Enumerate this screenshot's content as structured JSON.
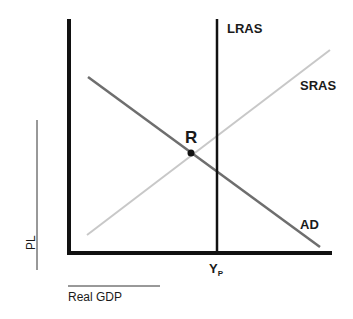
{
  "diagram": {
    "type": "AD-AS model",
    "axes": {
      "y_label": "PL",
      "x_label": "Real GDP"
    },
    "curves": [
      {
        "name": "LRAS",
        "label": "LRAS",
        "kind": "vertical",
        "color": "#111111"
      },
      {
        "name": "SRAS",
        "label": "SRAS",
        "kind": "upward-sloping",
        "color": "#c8c8c8"
      },
      {
        "name": "AD",
        "label": "AD",
        "kind": "downward-sloping",
        "color": "#6e6e6e"
      }
    ],
    "points": [
      {
        "label": "R",
        "description": "intersection of AD and SRAS"
      }
    ],
    "x_marker": {
      "main": "Y",
      "subscript": "P"
    }
  }
}
